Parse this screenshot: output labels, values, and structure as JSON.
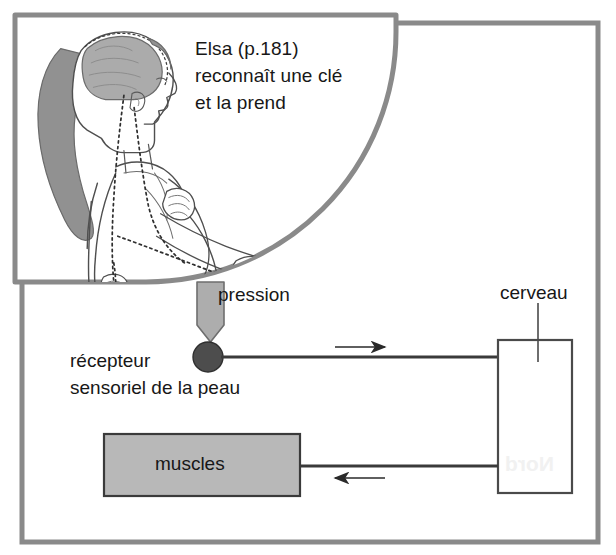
{
  "figure": {
    "kind": "biology-diagram",
    "language": "fr",
    "background_color": "#ffffff",
    "frame_color": "#878787",
    "ink_color": "#171717"
  },
  "top_panel": {
    "name": "illustration-panel",
    "caption": "Elsa (p.181)\nreconnaît une clé\net la prend",
    "illustration": {
      "name": "girl-profile-nerve-pathway",
      "description": "profil d'une fille avec cerveau ombré et trajets nerveux en pointillés vers la main tenant une clé",
      "brain_fill": "#a9a9a9",
      "hair_fill": "#8f8f8f",
      "outline_color": "#555555"
    }
  },
  "diagram": {
    "name": "reflex-arc-diagram",
    "pressure": {
      "label": "pression",
      "arrow_fill": "#adadad",
      "arrow_stroke": "#6e6e6e"
    },
    "receptor": {
      "label": "récepteur\nsensoriel de la peau",
      "dot_fill": "#4d4d4d",
      "dot_stroke": "#2f2f2f"
    },
    "brain": {
      "label": "cerveau",
      "box_fill": "#ffffff",
      "box_stroke": "#4a4a4a"
    },
    "muscles": {
      "label": "muscles",
      "box_fill": "#b8b8b8",
      "box_stroke": "#3a3a3a"
    },
    "connections": [
      {
        "name": "receptor-to-brain",
        "direction": "right",
        "arrow_glyph": "→"
      },
      {
        "name": "brain-to-muscles",
        "direction": "left",
        "arrow_glyph": "←"
      }
    ]
  },
  "artifacts": {
    "bleed_through_text": "Nord"
  }
}
